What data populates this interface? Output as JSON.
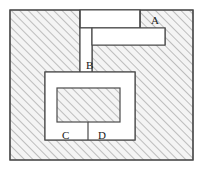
{
  "figure": {
    "title": "",
    "labels": {
      "a": "A",
      "b": "B",
      "c": "C",
      "d": "D"
    },
    "colors": {
      "background": "#ffffff",
      "outline": "#4a4a4a",
      "hatch_line": "#8a8a8a",
      "hatch_fill": "#f2f2f2",
      "label_text": "#1a1a1a"
    },
    "geometry": {
      "canvas": [
        202,
        169
      ],
      "outer_rect": [
        10,
        10,
        183,
        160
      ],
      "notch_top_right": [
        80,
        10,
        140,
        28
      ],
      "notch_step": [
        80,
        28,
        165,
        45
      ],
      "channel_vertical": [
        80,
        28,
        92,
        72
      ],
      "inner_white_rect": [
        45,
        72,
        135,
        140
      ],
      "inner_hatched_rect": [
        57,
        88,
        120,
        122
      ],
      "cd_divider_x": 88,
      "hatch_angle_deg": 45,
      "hatch_spacing_px": 6
    }
  }
}
